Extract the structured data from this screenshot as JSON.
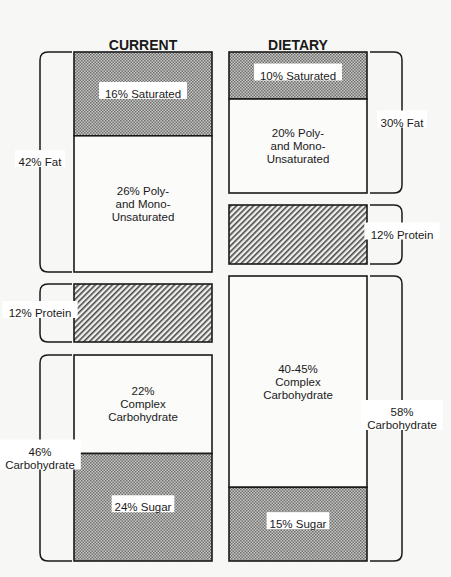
{
  "chart_data": {
    "type": "stacked-bar",
    "title": "",
    "columns": [
      {
        "key": "current",
        "title_lines": [
          "CURRENT",
          "DIET"
        ],
        "segments": [
          {
            "name": "saturated",
            "value": 16,
            "label_lines": [
              "16% Saturated"
            ],
            "fill": "dots",
            "group": "fat"
          },
          {
            "name": "unsaturated",
            "value": 26,
            "label_lines": [
              "26% Poly-",
              "and Mono-",
              "Unsaturated"
            ],
            "fill": "white",
            "group": "fat"
          },
          {
            "name": "protein",
            "value": 12,
            "label_lines": [],
            "fill": "hatch",
            "group": "protein"
          },
          {
            "name": "complex-carbohydrate",
            "value": 22,
            "label_lines": [
              "22%",
              "Complex",
              "Carbohydrate"
            ],
            "fill": "white",
            "group": "carbohydrate"
          },
          {
            "name": "sugar",
            "value": 24,
            "label_lines": [
              "24% Sugar"
            ],
            "fill": "dots",
            "group": "carbohydrate"
          }
        ],
        "groups": [
          {
            "name": "fat",
            "value": 42,
            "label_lines": [
              "42% Fat"
            ]
          },
          {
            "name": "protein",
            "value": 12,
            "label_lines": [
              "12% Protein"
            ]
          },
          {
            "name": "carbohydrate",
            "value": 46,
            "label_lines": [
              "46%",
              "Carbohydrate"
            ]
          }
        ]
      },
      {
        "key": "goals",
        "title_lines": [
          "DIETARY",
          "GOALS"
        ],
        "segments": [
          {
            "name": "saturated",
            "value": 10,
            "label_lines": [
              "10% Saturated"
            ],
            "fill": "dots",
            "group": "fat"
          },
          {
            "name": "unsaturated",
            "value": 20,
            "label_lines": [
              "20% Poly-",
              "and Mono-",
              "Unsaturated"
            ],
            "fill": "white",
            "group": "fat"
          },
          {
            "name": "protein",
            "value": 12,
            "label_lines": [],
            "fill": "hatch",
            "group": "protein"
          },
          {
            "name": "complex-carbohydrate",
            "value": 43,
            "value_range": [
              40,
              45
            ],
            "label_lines": [
              "40-45%",
              "Complex",
              "Carbohydrate"
            ],
            "fill": "white",
            "group": "carbohydrate"
          },
          {
            "name": "sugar",
            "value": 15,
            "label_lines": [
              "15% Sugar"
            ],
            "fill": "dots",
            "group": "carbohydrate"
          }
        ],
        "groups": [
          {
            "name": "fat",
            "value": 30,
            "label_lines": [
              "30% Fat"
            ]
          },
          {
            "name": "protein",
            "value": 12,
            "label_lines": [
              "12% Protein"
            ]
          },
          {
            "name": "carbohydrate",
            "value": 58,
            "label_lines": [
              "58%",
              "Carbohydrate"
            ]
          }
        ]
      }
    ],
    "units": "% of calories"
  }
}
